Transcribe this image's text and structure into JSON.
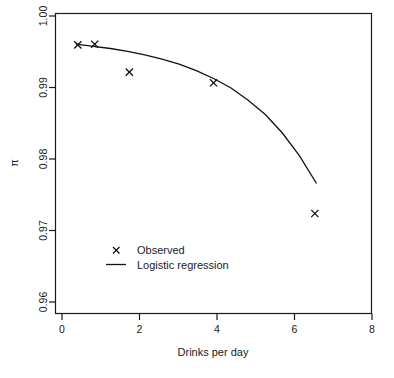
{
  "chart_data": {
    "type": "scatter",
    "title": "",
    "xlabel": "Drinks per day",
    "ylabel": "π",
    "xlim": [
      -0.6,
      8.6
    ],
    "ylim": [
      0.9585,
      1.0005
    ],
    "xticks": [
      0,
      2,
      4,
      6,
      8
    ],
    "xticklabels": [
      "0",
      "2",
      "4",
      "6",
      "8"
    ],
    "yticks": [
      0.96,
      0.97,
      0.98,
      0.99,
      1.0
    ],
    "yticklabels": [
      "0.96",
      "0.97",
      "0.98",
      "0.99",
      "1.00"
    ],
    "grid": false,
    "legend_position": "bottom-left",
    "series": [
      {
        "name": "Observed",
        "type": "scatter",
        "marker": "x",
        "color": "#111111",
        "x": [
          0.05,
          0.54,
          1.55,
          4.0,
          6.95
        ],
        "y": [
          0.9961,
          0.9962,
          0.9923,
          0.9908,
          0.9725
        ]
      },
      {
        "name": "Logistic regression",
        "type": "line",
        "color": "#111111",
        "x": [
          0.0,
          0.5,
          1.0,
          1.5,
          2.0,
          2.5,
          3.0,
          3.5,
          4.0,
          4.5,
          5.0,
          5.5,
          6.0,
          6.5,
          7.0
        ],
        "y": [
          0.9962,
          0.9959,
          0.9956,
          0.9952,
          0.9947,
          0.9941,
          0.9934,
          0.9925,
          0.9914,
          0.9901,
          0.9884,
          0.9864,
          0.9838,
          0.9806,
          0.9767
        ]
      }
    ]
  },
  "axes": {
    "x_axis_title": "Drinks per day",
    "y_axis_title": "π",
    "x_tick_labels": [
      "0",
      "2",
      "4",
      "6",
      "8"
    ],
    "y_tick_labels": [
      "1.00",
      "0.99",
      "0.98",
      "0.97",
      "0.96"
    ]
  },
  "legend": {
    "entries": [
      {
        "label": "Observed",
        "symbol": "x-marker"
      },
      {
        "label": "Logistic regression",
        "symbol": "line-segment"
      }
    ]
  }
}
